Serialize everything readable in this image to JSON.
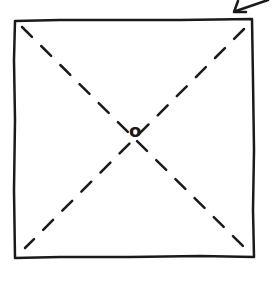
{
  "diagram": {
    "type": "hand-drawn sketch",
    "shapes": [
      {
        "kind": "square",
        "style": "solid",
        "name": "outer-square"
      },
      {
        "kind": "diagonal",
        "style": "dashed",
        "from": "top-left",
        "to": "bottom-right"
      },
      {
        "kind": "diagonal",
        "style": "dashed",
        "from": "top-right",
        "to": "bottom-left"
      },
      {
        "kind": "circle",
        "style": "small",
        "position": "center"
      },
      {
        "kind": "arrow",
        "direction": "down-left",
        "position": "top-right corner"
      }
    ],
    "center_label": "o",
    "colors": {
      "stroke": "#1a1a1a",
      "background": "#ffffff"
    }
  }
}
